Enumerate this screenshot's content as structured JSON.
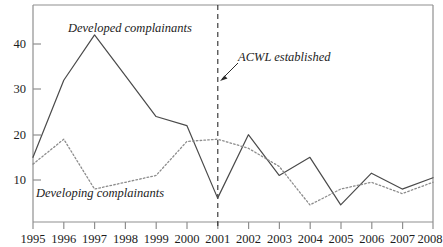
{
  "chart_data": {
    "type": "line",
    "title": "",
    "subtitle": "",
    "xlabel": "",
    "ylabel": "",
    "x": [
      1995,
      1996,
      1997,
      1998,
      1999,
      2000,
      2001,
      2002,
      2003,
      2004,
      2005,
      2006,
      2007,
      2008
    ],
    "categories": [
      "1995",
      "1996",
      "1997",
      "1998",
      "1999",
      "2000",
      "2001",
      "2002",
      "2003",
      "2004",
      "2005",
      "2006",
      "2007",
      "2008"
    ],
    "xlim": [
      1995,
      2008
    ],
    "ylim": [
      0,
      48
    ],
    "y_ticks": [
      10,
      20,
      30,
      40
    ],
    "y_tick_labels": [
      "10",
      "20",
      "30",
      "40"
    ],
    "grid": false,
    "legend_position": "inline-annotations",
    "series": [
      {
        "name": "Developed complainants",
        "style": "solid",
        "color": "#4a4a4a",
        "values": [
          15,
          32,
          42,
          33,
          24,
          22,
          6,
          20,
          11,
          15,
          4.5,
          11.5,
          8,
          10.5
        ]
      },
      {
        "name": "Developing complainants",
        "style": "dotted",
        "color": "#8c8c8c",
        "values": [
          13.5,
          19,
          8,
          9.5,
          11,
          18.5,
          19,
          17,
          13,
          4.5,
          8,
          9.5,
          7,
          9.5
        ]
      }
    ],
    "annotations": [
      {
        "text": "Developed complainants",
        "kind": "series-label",
        "target_series": "Developed complainants"
      },
      {
        "text": "Developing complainants",
        "kind": "series-label",
        "target_series": "Developing complainants"
      },
      {
        "text": "ACWL established",
        "kind": "event-label",
        "marker": "vertical-dashed-line",
        "marker_x": 2001,
        "arrow": true
      }
    ]
  },
  "axes": {
    "y_labels": [
      "40",
      "30",
      "20",
      "10"
    ],
    "x_labels": [
      "1995",
      "1996",
      "1997",
      "1998",
      "1999",
      "2000",
      "2001",
      "2002",
      "2003",
      "2004",
      "2005",
      "2006",
      "2007",
      "2008"
    ]
  },
  "labels": {
    "developed": "Developed complainants",
    "developing": "Developing complainants",
    "acwl": "ACWL established"
  },
  "colors": {
    "axis": "#8f8f8f",
    "solid_series": "#4a4a4a",
    "dotted_series": "#8c8c8c",
    "event_line": "#2b2b2b",
    "text": "#1c1c1c",
    "background": "#ffffff"
  }
}
